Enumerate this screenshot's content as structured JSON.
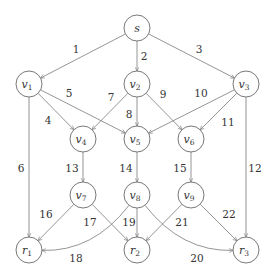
{
  "diagram": {
    "type": "directed-graph",
    "colors": {
      "edge": "#7a7a7a",
      "node_stroke": "#6a6a6a",
      "text": "#333333",
      "background": "#ffffff"
    },
    "nodes": [
      {
        "id": "s",
        "base": "s",
        "sub": "",
        "x": 137,
        "y": 28
      },
      {
        "id": "v1",
        "base": "v",
        "sub": "1",
        "x": 29,
        "y": 84
      },
      {
        "id": "v2",
        "base": "v",
        "sub": "2",
        "x": 137,
        "y": 84
      },
      {
        "id": "v3",
        "base": "v",
        "sub": "3",
        "x": 246,
        "y": 84
      },
      {
        "id": "v4",
        "base": "v",
        "sub": "4",
        "x": 83,
        "y": 139
      },
      {
        "id": "v5",
        "base": "v",
        "sub": "5",
        "x": 137,
        "y": 139
      },
      {
        "id": "v6",
        "base": "v",
        "sub": "6",
        "x": 191,
        "y": 139
      },
      {
        "id": "v7",
        "base": "v",
        "sub": "7",
        "x": 83,
        "y": 195
      },
      {
        "id": "v8",
        "base": "v",
        "sub": "8",
        "x": 137,
        "y": 195
      },
      {
        "id": "v9",
        "base": "v",
        "sub": "9",
        "x": 191,
        "y": 195
      },
      {
        "id": "r1",
        "base": "r",
        "sub": "1",
        "x": 29,
        "y": 250
      },
      {
        "id": "r2",
        "base": "r",
        "sub": "2",
        "x": 137,
        "y": 250
      },
      {
        "id": "r3",
        "base": "r",
        "sub": "3",
        "x": 246,
        "y": 250
      }
    ],
    "edges": [
      {
        "label": "1",
        "from": "s",
        "to": "v1",
        "lx": 76,
        "ly": 53
      },
      {
        "label": "2",
        "from": "s",
        "to": "v2",
        "lx": 144,
        "ly": 60
      },
      {
        "label": "3",
        "from": "s",
        "to": "v3",
        "lx": 199,
        "ly": 53
      },
      {
        "label": "4",
        "from": "v1",
        "to": "v4",
        "lx": 48,
        "ly": 124
      },
      {
        "label": "5",
        "from": "v1",
        "to": "v5",
        "lx": 69,
        "ly": 97
      },
      {
        "label": "6",
        "from": "v1",
        "to": "r1",
        "lx": 21,
        "ly": 172
      },
      {
        "label": "7",
        "from": "v2",
        "to": "v4",
        "lx": 111,
        "ly": 101
      },
      {
        "label": "8",
        "from": "v2",
        "to": "v5",
        "lx": 129,
        "ly": 118
      },
      {
        "label": "9",
        "from": "v2",
        "to": "v6",
        "lx": 163,
        "ly": 98
      },
      {
        "label": "10",
        "from": "v3",
        "to": "v5",
        "lx": 201,
        "ly": 97
      },
      {
        "label": "11",
        "from": "v3",
        "to": "v6",
        "lx": 228,
        "ly": 126
      },
      {
        "label": "12",
        "from": "v3",
        "to": "r3",
        "lx": 255,
        "ly": 172
      },
      {
        "label": "13",
        "from": "v4",
        "to": "v7",
        "lx": 72,
        "ly": 172
      },
      {
        "label": "14",
        "from": "v5",
        "to": "v8",
        "lx": 126,
        "ly": 172
      },
      {
        "label": "15",
        "from": "v6",
        "to": "v9",
        "lx": 180,
        "ly": 172
      },
      {
        "label": "16",
        "from": "v7",
        "to": "r1",
        "lx": 46,
        "ly": 218
      },
      {
        "label": "17",
        "from": "v7",
        "to": "r2",
        "lx": 90,
        "ly": 226
      },
      {
        "label": "18",
        "from": "v8",
        "to": "r1",
        "lx": 76,
        "ly": 262,
        "curve": true
      },
      {
        "label": "19",
        "from": "v8",
        "to": "r2",
        "lx": 129,
        "ly": 226
      },
      {
        "label": "20",
        "from": "v8",
        "to": "r3",
        "lx": 197,
        "ly": 262,
        "curve": true
      },
      {
        "label": "21",
        "from": "v9",
        "to": "r2",
        "lx": 182,
        "ly": 226
      },
      {
        "label": "22",
        "from": "v9",
        "to": "r3",
        "lx": 229,
        "ly": 218
      }
    ]
  }
}
